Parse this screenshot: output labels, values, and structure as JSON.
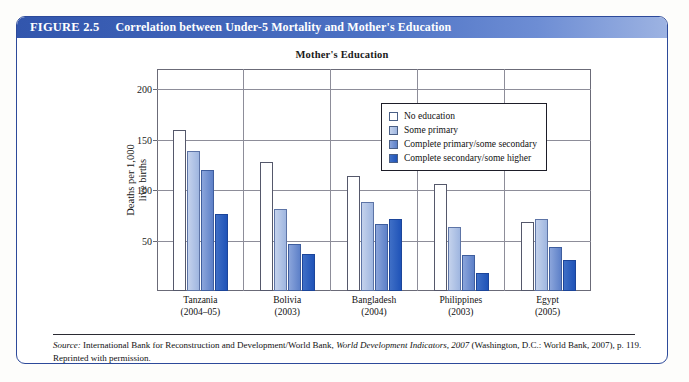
{
  "figure": {
    "number": "FIGURE 2.5",
    "title": "Correlation between Under-5 Mortality and Mother's Education"
  },
  "source_note": {
    "label": "Source:",
    "text_before_italic": " International Bank for Reconstruction and Development/World Bank, ",
    "italic_title": "World Development Indicators, 2007",
    "text_after_italic": " (Washington, D.C.: World Bank, 2007), p. 119. Reprinted with permission."
  },
  "chart_data": {
    "type": "bar",
    "title": "Mother's Education",
    "xlabel": "",
    "ylabel": "Deaths per 1,000 live births",
    "ylim": [
      0,
      220
    ],
    "yticks": [
      50,
      100,
      150,
      200
    ],
    "grid": true,
    "legend_position": "top-right-inside",
    "categories": [
      "Tanzania\n(2004–05)",
      "Bolivia\n(2003)",
      "Bangladesh\n(2004)",
      "Philippines\n(2003)",
      "Egypt\n(2005)"
    ],
    "category_names": [
      "Tanzania",
      "Bolivia",
      "Bangladesh",
      "Philippines",
      "Egypt"
    ],
    "category_years": [
      "(2004–05)",
      "(2003)",
      "(2004)",
      "(2003)",
      "(2005)"
    ],
    "series": [
      {
        "name": "No education",
        "color": "#ffffff",
        "values": [
          160,
          128,
          114,
          106,
          68
        ]
      },
      {
        "name": "Some primary",
        "color": "#b2c4e6",
        "values": [
          139,
          81,
          88,
          63,
          71
        ]
      },
      {
        "name": "Complete primary/some secondary",
        "color": "#6f8fd0",
        "values": [
          120,
          47,
          66,
          36,
          44
        ]
      },
      {
        "name": "Complete secondary/some higher",
        "color": "#2458bd",
        "values": [
          76,
          37,
          71,
          18,
          31
        ]
      }
    ]
  }
}
